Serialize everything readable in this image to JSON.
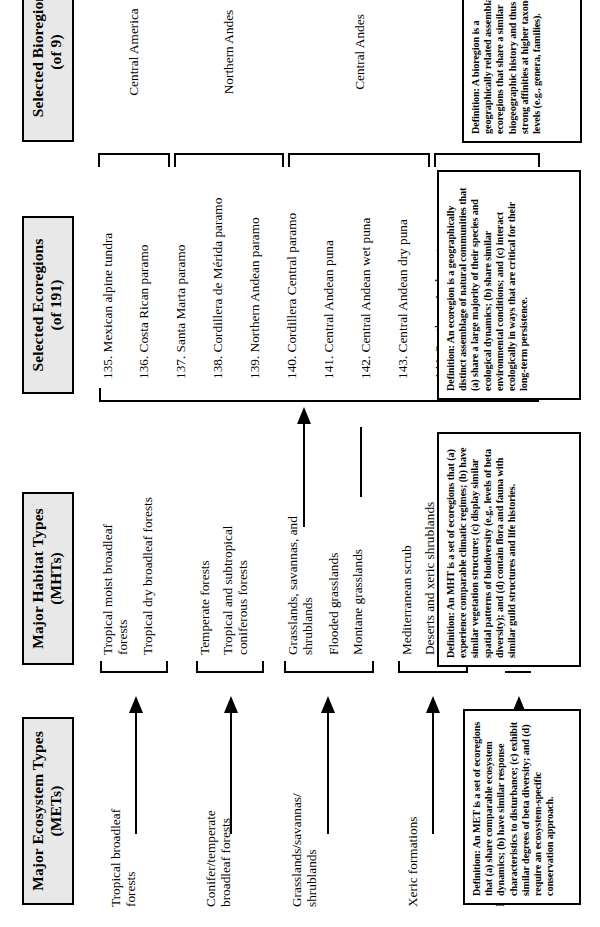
{
  "diagram": {
    "columns": [
      {
        "key": "mets",
        "header": "Major Ecosystem Types",
        "sub": "(METs)"
      },
      {
        "key": "mhts",
        "header": "Major Habitat Types",
        "sub": "(MHTs)"
      },
      {
        "key": "ecoregions",
        "header": "Selected Ecoregions",
        "sub": "(of 191)"
      },
      {
        "key": "bioregions",
        "header": "Selected Bioregions",
        "sub": "(of 9)"
      }
    ],
    "mets": [
      {
        "label": "Tropical broadleaf\nforests"
      },
      {
        "label": "Conifer/temperate\nbroadleaf forests"
      },
      {
        "label": "Grasslands/savannas/\nshrublands"
      },
      {
        "label": "Xeric  formations"
      },
      {
        "label": "Mangroves"
      }
    ],
    "mhts": [
      {
        "label": "Tropical moist broadleaf\nforests"
      },
      {
        "label": "Tropical dry broadleaf forests"
      },
      {
        "label": "Temperate forests"
      },
      {
        "label": "Tropical and subtropical\nconiferous forests"
      },
      {
        "label": "Grasslands, savannas, and\nshrublands"
      },
      {
        "label": "Flooded grasslands"
      },
      {
        "label": "Montane grasslands"
      },
      {
        "label": "Mediterranean scrub"
      },
      {
        "label": "Deserts and xeric shrublands"
      },
      {
        "label": "Restingas"
      },
      {
        "label": "Mangroves"
      }
    ],
    "ecoregions": [
      {
        "label": "135. Mexican alpine tundra"
      },
      {
        "label": "136. Costa Rican paramo"
      },
      {
        "label": "137. Santa Marta paramo"
      },
      {
        "label": "138. Cordillera de Mérida paramo"
      },
      {
        "label": "139. Northern Andean paramo"
      },
      {
        "label": "140. Cordillera Central paramo"
      },
      {
        "label": "141. Central Andean puna"
      },
      {
        "label": "142. Central Andean wet puna"
      },
      {
        "label": "143. Central Andean dry puna"
      },
      {
        "label": "144. Southern Andean steppe"
      },
      {
        "label": "145. Patagonian steppe"
      },
      {
        "label": "146. Patagonian grasslands"
      }
    ],
    "bioregions": [
      {
        "label": "Central America"
      },
      {
        "label": "Northern Andes"
      },
      {
        "label": "Central Andes"
      },
      {
        "label": "Southern South\nAmerica"
      }
    ],
    "definitions": {
      "met": "Definition:  An MET is a set of ecoregions that (a) share comparable ecosystem dynamics; (b) have similar response characteristics to disturbance; (c) exhibit similar degrees of beta diversity; and (d) require an ecosystem-specific conservation approach.",
      "mht": "Definition:  An MHT is a set of ecoregions that (a) experience comparable climatic regimes; (b) have similar vegetation structure; (c) display similar spatial patterns of biodiversity (e.g., levels of beta diversity); and (d) contain flora and fauna with similar guild structures and life histories.",
      "ecoregion": "Definition:  An ecoregion is a geographically distinct assemblage of natural communities that (a) share a large majority of their species and ecological dynamics; (b) share similar environmental conditions; and (c) interact ecologically in ways that are critical for their long-term persistence.",
      "bioregion": "Definition:  A bioregion is a geographically related assemblage of ecoregions that share a similar biogeographic history and thus have strong affinities at higher taxonomic levels (e.g., genera, families)."
    }
  }
}
